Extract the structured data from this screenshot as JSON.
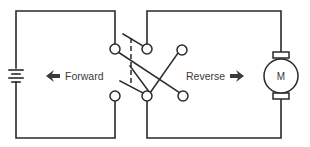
{
  "diagram": {
    "type": "dpdt-reversing-switch-motor-circuit",
    "labels": {
      "forward": "Forward",
      "reverse": "Reverse",
      "motor": "M"
    },
    "components": {
      "battery": "battery-icon",
      "switch": "double-pole-double-throw-switch",
      "motor": "dc-motor"
    },
    "colors": {
      "line": "#2a2a2a",
      "text": "#3a3a3a",
      "background": "#ffffff"
    }
  }
}
